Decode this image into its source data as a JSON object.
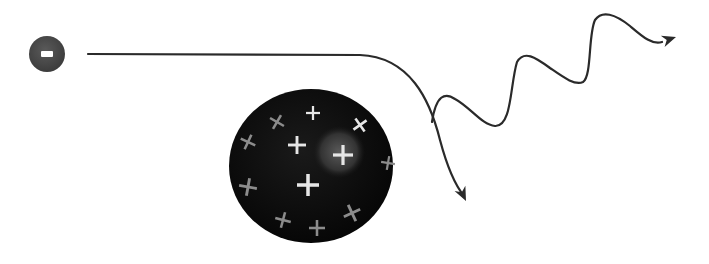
{
  "diagram": {
    "kind": "bremsstrahlung-illustration",
    "colors": {
      "background": "#ffffff",
      "line": "#2a2a2a",
      "electron_fill": "#4a4a4a",
      "electron_sign": "#ffffff",
      "nucleus_fill": "#0c0c0c",
      "nucleus_highlight": "#4a4a4a",
      "plus_bright": "#e6e6e6",
      "plus_dim": "#8c8c8c"
    },
    "electron": {
      "cx": 47,
      "cy": 54,
      "r": 18,
      "sign": "minus"
    },
    "electron_path": {
      "d": "M 88 54 L 360 55 C 410 57 430 100 440 140 C 448 170 455 185 464 196",
      "arrow_tip": [
        466,
        201
      ]
    },
    "photon_path": {
      "d": "M 432 122 C 436 95 445 92 455 99 C 470 107 482 125 495 126 C 512 127 510 85 517 62 C 524 50 535 57 550 68 C 563 77 575 86 583 82 C 592 76 588 35 595 20 C 602 10 615 14 630 26 C 643 37 652 45 662 42",
      "arrow_tip": [
        676,
        37
      ]
    },
    "nucleus": {
      "cx": 311,
      "cy": 166,
      "rx": 82,
      "ry": 77,
      "highlight": {
        "cx": 339,
        "cy": 152,
        "r": 26
      },
      "protons": [
        {
          "x": 313,
          "y": 113,
          "size": 7,
          "rot": 0,
          "tone": "bright"
        },
        {
          "x": 277,
          "y": 122,
          "size": 8,
          "rot": 30,
          "tone": "dim"
        },
        {
          "x": 360,
          "y": 125,
          "size": 8,
          "rot": -35,
          "tone": "bright"
        },
        {
          "x": 248,
          "y": 142,
          "size": 8,
          "rot": 25,
          "tone": "dim"
        },
        {
          "x": 297,
          "y": 145,
          "size": 9,
          "rot": 0,
          "tone": "bright"
        },
        {
          "x": 343,
          "y": 155,
          "size": 10,
          "rot": 0,
          "tone": "bright"
        },
        {
          "x": 388,
          "y": 163,
          "size": 7,
          "rot": 10,
          "tone": "dim"
        },
        {
          "x": 308,
          "y": 185,
          "size": 11,
          "rot": 0,
          "tone": "bright"
        },
        {
          "x": 248,
          "y": 187,
          "size": 9,
          "rot": 10,
          "tone": "dim"
        },
        {
          "x": 283,
          "y": 220,
          "size": 8,
          "rot": 15,
          "tone": "dim"
        },
        {
          "x": 352,
          "y": 213,
          "size": 9,
          "rot": -25,
          "tone": "dim"
        },
        {
          "x": 317,
          "y": 228,
          "size": 8,
          "rot": 0,
          "tone": "dim"
        }
      ]
    }
  }
}
